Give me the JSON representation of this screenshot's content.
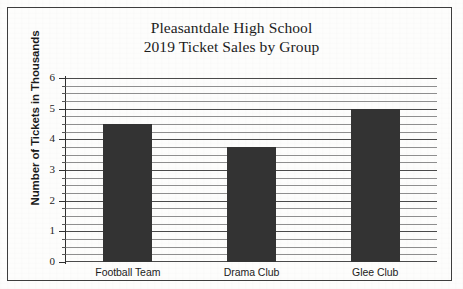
{
  "chart_data": {
    "type": "bar",
    "title": "Pleasantdale High School 2019 Ticket Sales by Group",
    "title_lines": [
      "Pleasantdale High School",
      "2019 Ticket Sales by Group"
    ],
    "categories": [
      "Football Team",
      "Drama Club",
      "Glee Club"
    ],
    "values": [
      4.5,
      3.75,
      5.0
    ],
    "xlabel": "",
    "ylabel": "Number of Tickets in Thousands",
    "ylim": [
      0,
      6
    ],
    "ytick_labels": [
      "0",
      "1",
      "2",
      "3",
      "4",
      "5",
      "6"
    ],
    "ytick_values": [
      0,
      1,
      2,
      3,
      4,
      5,
      6
    ],
    "grid": "horizontal",
    "minor_grid_step": 0.25,
    "legend": "none",
    "bar_color": "#333333",
    "gridline_color": "#8e8e8e",
    "axis_color": "#2f2f2f",
    "background_color": "#fdfdfc"
  }
}
